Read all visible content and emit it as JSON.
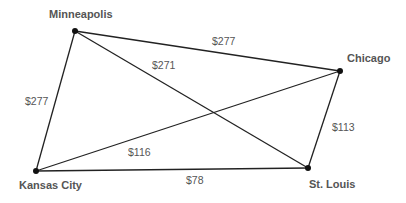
{
  "diagram": {
    "type": "weighted-graph",
    "nodes": [
      {
        "id": "minneapolis",
        "label": "Minneapolis",
        "x": 75,
        "y": 31
      },
      {
        "id": "chicago",
        "label": "Chicago",
        "x": 340,
        "y": 71
      },
      {
        "id": "kansas_city",
        "label": "Kansas City",
        "x": 36,
        "y": 171
      },
      {
        "id": "st_louis",
        "label": "St. Louis",
        "x": 308,
        "y": 168
      }
    ],
    "edges": [
      {
        "from": "minneapolis",
        "to": "chicago",
        "label": "$277"
      },
      {
        "from": "minneapolis",
        "to": "st_louis",
        "label": "$271"
      },
      {
        "from": "minneapolis",
        "to": "kansas_city",
        "label": "$277"
      },
      {
        "from": "kansas_city",
        "to": "chicago",
        "label": "$116"
      },
      {
        "from": "kansas_city",
        "to": "st_louis",
        "label": "$78"
      },
      {
        "from": "chicago",
        "to": "st_louis",
        "label": "$113"
      }
    ],
    "colors": {
      "line": "#222222",
      "node": "#111111",
      "text": "#555555"
    }
  }
}
